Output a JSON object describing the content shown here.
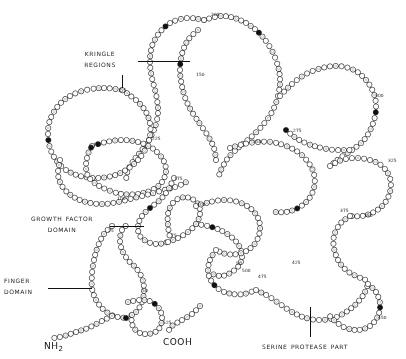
{
  "figure": {
    "background_color": "#ffffff",
    "ink_color": "#1a1a1a",
    "width": 406,
    "height": 359
  },
  "annotations": [
    {
      "id": "kringle-regions",
      "line1": "Kringle",
      "line2": "regions",
      "x": 62,
      "y": 48,
      "align": "center",
      "leader": {
        "type": "h",
        "x": 138,
        "y": 61,
        "length": 52
      },
      "tick": {
        "type": "v",
        "x": 122,
        "y": 75,
        "length": 13
      }
    },
    {
      "id": "growth-factor-domain",
      "line1": "Growth factor",
      "line2": "domain",
      "x": 14,
      "y": 213,
      "align": "center",
      "leader": {
        "type": "h",
        "x": 110,
        "y": 226,
        "length": 34
      },
      "tick": null
    },
    {
      "id": "finger-domain",
      "line1": "Finger",
      "line2": "domain",
      "x": 4,
      "y": 275,
      "align": "left",
      "leader": {
        "type": "h",
        "x": 48,
        "y": 288,
        "length": 44
      },
      "tick": null
    },
    {
      "id": "serine-protease-part",
      "line1": "Serine protease part",
      "line2": "",
      "x": 262,
      "y": 341,
      "align": "left",
      "leader": null,
      "tick": {
        "type": "v",
        "x": 310,
        "y": 307,
        "length": 30
      }
    }
  ],
  "termini": [
    {
      "id": "n-terminus",
      "text": "NH",
      "sub": "2",
      "x": 44,
      "y": 341
    },
    {
      "id": "c-terminus",
      "text": "COOH",
      "sub": "",
      "x": 163,
      "y": 337
    }
  ],
  "residue_numbers": [
    {
      "label": "125",
      "x": 118,
      "y": 88
    },
    {
      "label": "200",
      "x": 211,
      "y": 12
    },
    {
      "label": "150",
      "x": 196,
      "y": 72
    },
    {
      "label": "150",
      "x": 93,
      "y": 142
    },
    {
      "label": "100",
      "x": 117,
      "y": 196
    },
    {
      "label": "175",
      "x": 174,
      "y": 176
    },
    {
      "label": "225",
      "x": 152,
      "y": 136
    },
    {
      "label": "250",
      "x": 253,
      "y": 139
    },
    {
      "label": "275",
      "x": 293,
      "y": 128
    },
    {
      "label": "300",
      "x": 375,
      "y": 93
    },
    {
      "label": "325",
      "x": 388,
      "y": 158
    },
    {
      "label": "350",
      "x": 364,
      "y": 213
    },
    {
      "label": "375",
      "x": 340,
      "y": 208
    },
    {
      "label": "400",
      "x": 197,
      "y": 202
    },
    {
      "label": "425",
      "x": 292,
      "y": 260
    },
    {
      "label": "450",
      "x": 378,
      "y": 315
    },
    {
      "label": "475",
      "x": 258,
      "y": 274
    },
    {
      "label": "500",
      "x": 242,
      "y": 268
    },
    {
      "label": "525",
      "x": 163,
      "y": 320
    },
    {
      "label": "75",
      "x": 171,
      "y": 233
    },
    {
      "label": "50",
      "x": 142,
      "y": 288
    },
    {
      "label": "25",
      "x": 108,
      "y": 228
    },
    {
      "label": "50",
      "x": 236,
      "y": 261
    }
  ],
  "chain_paths": [
    {
      "id": "chain-kringle2-upper-loop",
      "points": [
        [
          204,
          20
        ],
        [
          222,
          16
        ],
        [
          240,
          20
        ],
        [
          256,
          30
        ],
        [
          268,
          44
        ],
        [
          276,
          60
        ],
        [
          280,
          78
        ],
        [
          278,
          96
        ],
        [
          272,
          112
        ],
        [
          262,
          126
        ],
        [
          250,
          138
        ],
        [
          238,
          148
        ],
        [
          228,
          158
        ],
        [
          222,
          168
        ],
        [
          218,
          178
        ]
      ]
    },
    {
      "id": "chain-kringle2-left",
      "points": [
        [
          204,
          20
        ],
        [
          188,
          18
        ],
        [
          172,
          22
        ],
        [
          160,
          32
        ],
        [
          152,
          46
        ],
        [
          150,
          62
        ],
        [
          152,
          78
        ],
        [
          156,
          94
        ],
        [
          158,
          110
        ],
        [
          156,
          124
        ],
        [
          150,
          138
        ],
        [
          142,
          150
        ],
        [
          134,
          160
        ],
        [
          128,
          170
        ],
        [
          126,
          180
        ]
      ]
    },
    {
      "id": "chain-kringle2-inner",
      "points": [
        [
          198,
          30
        ],
        [
          188,
          40
        ],
        [
          182,
          54
        ],
        [
          180,
          70
        ],
        [
          182,
          86
        ],
        [
          186,
          100
        ],
        [
          192,
          112
        ],
        [
          200,
          124
        ],
        [
          208,
          136
        ],
        [
          214,
          148
        ],
        [
          216,
          160
        ]
      ]
    },
    {
      "id": "chain-kringle1-big-loop",
      "points": [
        [
          122,
          90
        ],
        [
          104,
          88
        ],
        [
          86,
          90
        ],
        [
          70,
          96
        ],
        [
          58,
          106
        ],
        [
          50,
          120
        ],
        [
          48,
          134
        ],
        [
          50,
          148
        ],
        [
          56,
          160
        ],
        [
          66,
          170
        ],
        [
          80,
          176
        ],
        [
          96,
          178
        ],
        [
          112,
          176
        ],
        [
          126,
          170
        ],
        [
          138,
          160
        ],
        [
          146,
          148
        ],
        [
          150,
          136
        ],
        [
          150,
          124
        ],
        [
          146,
          112
        ],
        [
          138,
          102
        ],
        [
          128,
          94
        ],
        [
          122,
          90
        ]
      ]
    },
    {
      "id": "chain-kringle1-inner-loop",
      "points": [
        [
          92,
          146
        ],
        [
          106,
          142
        ],
        [
          122,
          140
        ],
        [
          138,
          142
        ],
        [
          152,
          148
        ],
        [
          162,
          158
        ],
        [
          166,
          170
        ],
        [
          162,
          182
        ],
        [
          152,
          190
        ],
        [
          138,
          194
        ],
        [
          122,
          194
        ],
        [
          108,
          190
        ],
        [
          96,
          184
        ],
        [
          88,
          176
        ],
        [
          86,
          166
        ],
        [
          88,
          154
        ],
        [
          92,
          146
        ]
      ]
    },
    {
      "id": "chain-kringle1-lower",
      "points": [
        [
          60,
          160
        ],
        [
          58,
          174
        ],
        [
          62,
          186
        ],
        [
          72,
          196
        ],
        [
          86,
          202
        ],
        [
          102,
          204
        ],
        [
          118,
          202
        ],
        [
          134,
          198
        ],
        [
          150,
          194
        ],
        [
          164,
          190
        ],
        [
          178,
          186
        ],
        [
          190,
          180
        ]
      ]
    },
    {
      "id": "chain-link-kringle-gf",
      "points": [
        [
          174,
          178
        ],
        [
          168,
          190
        ],
        [
          160,
          200
        ],
        [
          150,
          208
        ],
        [
          142,
          216
        ],
        [
          138,
          226
        ],
        [
          140,
          236
        ],
        [
          148,
          242
        ],
        [
          158,
          244
        ],
        [
          168,
          242
        ]
      ]
    },
    {
      "id": "chain-gf-loop",
      "points": [
        [
          168,
          242
        ],
        [
          178,
          238
        ],
        [
          188,
          232
        ],
        [
          196,
          224
        ],
        [
          200,
          214
        ],
        [
          198,
          204
        ],
        [
          190,
          198
        ],
        [
          180,
          198
        ],
        [
          172,
          204
        ],
        [
          168,
          214
        ],
        [
          168,
          226
        ],
        [
          170,
          238
        ]
      ]
    },
    {
      "id": "chain-gf-right",
      "points": [
        [
          196,
          224
        ],
        [
          208,
          226
        ],
        [
          220,
          230
        ],
        [
          230,
          236
        ],
        [
          238,
          244
        ],
        [
          242,
          254
        ],
        [
          240,
          264
        ],
        [
          232,
          272
        ],
        [
          222,
          276
        ],
        [
          212,
          274
        ]
      ]
    },
    {
      "id": "chain-finger-left",
      "points": [
        [
          112,
          226
        ],
        [
          104,
          234
        ],
        [
          98,
          246
        ],
        [
          94,
          260
        ],
        [
          92,
          274
        ],
        [
          92,
          288
        ],
        [
          96,
          300
        ],
        [
          104,
          310
        ],
        [
          114,
          316
        ],
        [
          126,
          318
        ]
      ]
    },
    {
      "id": "chain-finger-loop",
      "points": [
        [
          126,
          318
        ],
        [
          136,
          312
        ],
        [
          142,
          302
        ],
        [
          144,
          290
        ],
        [
          142,
          278
        ],
        [
          136,
          268
        ],
        [
          128,
          260
        ],
        [
          122,
          250
        ],
        [
          120,
          240
        ],
        [
          122,
          230
        ],
        [
          128,
          224
        ]
      ]
    },
    {
      "id": "chain-finger-bottom",
      "points": [
        [
          112,
          316
        ],
        [
          100,
          322
        ],
        [
          88,
          328
        ],
        [
          76,
          332
        ],
        [
          64,
          336
        ],
        [
          54,
          338
        ]
      ]
    },
    {
      "id": "chain-finger-stub",
      "points": [
        [
          128,
          302
        ],
        [
          140,
          300
        ],
        [
          152,
          302
        ],
        [
          160,
          310
        ],
        [
          162,
          320
        ],
        [
          158,
          330
        ],
        [
          148,
          334
        ],
        [
          138,
          332
        ],
        [
          132,
          324
        ],
        [
          132,
          314
        ]
      ]
    },
    {
      "id": "chain-protease-top-right",
      "points": [
        [
          280,
          96
        ],
        [
          292,
          84
        ],
        [
          306,
          74
        ],
        [
          322,
          68
        ],
        [
          338,
          66
        ],
        [
          354,
          70
        ],
        [
          366,
          80
        ],
        [
          374,
          94
        ],
        [
          376,
          110
        ],
        [
          372,
          126
        ],
        [
          364,
          140
        ],
        [
          352,
          150
        ],
        [
          340,
          158
        ],
        [
          330,
          166
        ]
      ]
    },
    {
      "id": "chain-protease-right-loop",
      "points": [
        [
          330,
          166
        ],
        [
          342,
          160
        ],
        [
          356,
          158
        ],
        [
          370,
          160
        ],
        [
          382,
          166
        ],
        [
          390,
          178
        ],
        [
          390,
          192
        ],
        [
          384,
          204
        ],
        [
          374,
          212
        ],
        [
          362,
          216
        ],
        [
          350,
          216
        ]
      ]
    },
    {
      "id": "chain-protease-mid",
      "points": [
        [
          286,
          130
        ],
        [
          296,
          138
        ],
        [
          308,
          144
        ],
        [
          322,
          148
        ],
        [
          336,
          150
        ],
        [
          350,
          150
        ]
      ]
    },
    {
      "id": "chain-protease-center",
      "points": [
        [
          230,
          148
        ],
        [
          244,
          144
        ],
        [
          258,
          142
        ],
        [
          272,
          142
        ],
        [
          286,
          146
        ],
        [
          298,
          152
        ],
        [
          308,
          162
        ],
        [
          314,
          174
        ],
        [
          314,
          188
        ],
        [
          308,
          200
        ],
        [
          298,
          208
        ],
        [
          286,
          212
        ],
        [
          274,
          212
        ]
      ]
    },
    {
      "id": "chain-protease-lower-left",
      "points": [
        [
          196,
          206
        ],
        [
          210,
          202
        ],
        [
          224,
          200
        ],
        [
          238,
          202
        ],
        [
          250,
          208
        ],
        [
          258,
          218
        ],
        [
          260,
          230
        ],
        [
          256,
          242
        ],
        [
          248,
          250
        ],
        [
          238,
          254
        ],
        [
          226,
          254
        ],
        [
          216,
          250
        ]
      ]
    },
    {
      "id": "chain-protease-lower-mid",
      "points": [
        [
          216,
          250
        ],
        [
          210,
          260
        ],
        [
          208,
          272
        ],
        [
          212,
          282
        ],
        [
          220,
          290
        ],
        [
          232,
          294
        ],
        [
          244,
          294
        ],
        [
          256,
          290
        ]
      ]
    },
    {
      "id": "chain-protease-bottom",
      "points": [
        [
          256,
          290
        ],
        [
          268,
          296
        ],
        [
          280,
          304
        ],
        [
          292,
          312
        ],
        [
          306,
          318
        ],
        [
          320,
          320
        ],
        [
          334,
          318
        ],
        [
          346,
          312
        ],
        [
          356,
          304
        ],
        [
          364,
          294
        ],
        [
          368,
          284
        ]
      ]
    },
    {
      "id": "chain-protease-bottom-right",
      "points": [
        [
          368,
          284
        ],
        [
          376,
          292
        ],
        [
          380,
          304
        ],
        [
          378,
          316
        ],
        [
          370,
          326
        ],
        [
          358,
          330
        ],
        [
          346,
          328
        ],
        [
          336,
          322
        ],
        [
          328,
          314
        ]
      ]
    },
    {
      "id": "chain-protease-far-right",
      "points": [
        [
          350,
          216
        ],
        [
          340,
          224
        ],
        [
          334,
          236
        ],
        [
          334,
          248
        ],
        [
          338,
          260
        ],
        [
          346,
          270
        ],
        [
          356,
          276
        ],
        [
          366,
          280
        ]
      ]
    },
    {
      "id": "chain-cooh-tail",
      "points": [
        [
          200,
          306
        ],
        [
          192,
          314
        ],
        [
          182,
          320
        ],
        [
          172,
          326
        ],
        [
          168,
          332
        ]
      ]
    }
  ],
  "residue_style": {
    "radius": 2.6,
    "spacing": 5.2,
    "stroke": "#2a2a2a",
    "fill": "#ffffff",
    "filled_fill": "#111111"
  }
}
